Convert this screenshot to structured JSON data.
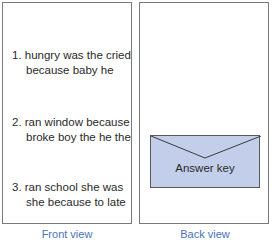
{
  "front": {
    "caption": "Front view",
    "sentences": [
      {
        "line1": "1. hungry was the cried",
        "line2": "because baby he"
      },
      {
        "line1": "2. ran window because",
        "line2": "broke boy the he the"
      },
      {
        "line1": "3. ran school she was",
        "line2": "she because to late"
      }
    ]
  },
  "back": {
    "caption": "Back view",
    "envelope_label": "Answer key",
    "envelope_color": "#c3cfea"
  },
  "colors": {
    "caption": "#4a72b8",
    "border": "#7a7a7a",
    "text": "#2a2a2a"
  }
}
